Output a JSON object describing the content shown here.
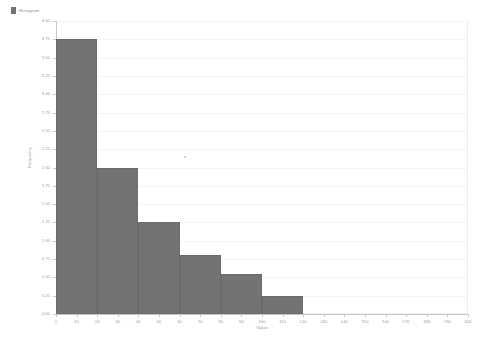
{
  "legend": {
    "label": "Histogram",
    "swatch_color": "#737373",
    "position": "top-left"
  },
  "axes": {
    "y_title": "Frequency",
    "x_title": "Value",
    "y_ticks": [
      "0.00",
      "0.25",
      "0.50",
      "0.75",
      "1.00",
      "1.25",
      "1.50",
      "1.75",
      "2.00",
      "2.25",
      "2.50",
      "2.75",
      "3.00",
      "3.25",
      "3.50",
      "3.75",
      "4.00"
    ],
    "x_ticks": [
      "0",
      "10",
      "20",
      "30",
      "40",
      "50",
      "60",
      "70",
      "80",
      "90",
      "100",
      "110",
      "120",
      "130",
      "140",
      "150",
      "160",
      "170",
      "180",
      "190",
      "200"
    ]
  },
  "colors": {
    "bar": "#737373",
    "bar_border": "#6b6b6b",
    "grid": "#f4f4f4",
    "axis": "#c8c8c8",
    "frame": "#ededed",
    "text": "#9a9a9a",
    "background": "#ffffff"
  },
  "chart_data": {
    "type": "bar",
    "title": "Histogram",
    "xlabel": "Value",
    "ylabel": "Frequency",
    "xlim": [
      0,
      200
    ],
    "ylim": [
      0,
      4.0
    ],
    "grid": true,
    "legend": [
      "Histogram"
    ],
    "legend_position": "top-left",
    "bin_width": 20,
    "bin_edges": [
      0,
      20,
      40,
      60,
      80,
      100,
      120
    ],
    "categories": [
      "0-20",
      "20-40",
      "40-60",
      "60-80",
      "80-100",
      "100-120"
    ],
    "values": [
      3.75,
      2.0,
      1.25,
      0.8,
      0.55,
      0.25
    ],
    "series": [
      {
        "name": "Histogram",
        "values": [
          3.75,
          2.0,
          1.25,
          0.8,
          0.55,
          0.25
        ]
      }
    ]
  }
}
